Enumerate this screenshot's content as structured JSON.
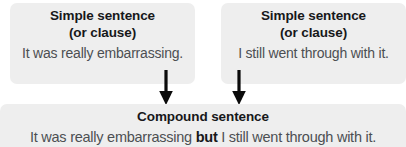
{
  "diagram": {
    "background_color": "#ffffff",
    "box_color": "#eeeeee",
    "heading_color": "#17181a",
    "body_color": "#4c4f52",
    "arrow_color": "#000000"
  },
  "clauses": [
    {
      "heading_line1": "Simple sentence",
      "heading_line2": "(or clause)",
      "example": "It was really embarrassing."
    },
    {
      "heading_line1": "Simple sentence",
      "heading_line2": "(or clause)",
      "example": "I still went through with it."
    }
  ],
  "result": {
    "heading": "Compound sentence",
    "sentence_part1": "It was really embarrassing ",
    "conjunction": "but",
    "sentence_part2": " I still went through with it."
  },
  "arrows": [
    {
      "name": "arrow-left-clause-to-compound"
    },
    {
      "name": "arrow-right-clause-to-compound"
    }
  ]
}
